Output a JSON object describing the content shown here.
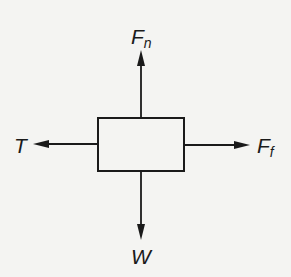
{
  "diagram": {
    "type": "free-body-diagram",
    "colors": {
      "background": "#f4f4f2",
      "stroke": "#1a1a1a"
    },
    "body": {
      "shape": "rectangle",
      "x": 98,
      "y": 118,
      "width": 86,
      "height": 53
    },
    "forces": {
      "normal": {
        "symbol": "F",
        "subscript": "n",
        "direction": "up"
      },
      "tension": {
        "symbol": "T",
        "direction": "left"
      },
      "friction": {
        "symbol": "F",
        "subscript": "f",
        "direction": "right"
      },
      "weight": {
        "symbol": "W",
        "direction": "down"
      }
    }
  }
}
